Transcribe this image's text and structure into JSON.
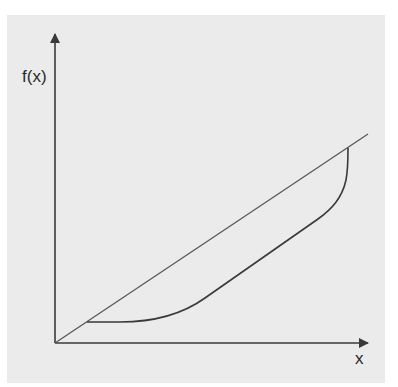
{
  "diagram": {
    "type": "function-plot",
    "y_axis_label": "f(x)",
    "x_axis_label": "x",
    "colors": {
      "background": "#ebebeb",
      "stroke": "#3a3a3a",
      "text": "#2a2a2a"
    },
    "elements": [
      {
        "name": "y-axis",
        "kind": "arrow",
        "from": [
          55,
          343
        ],
        "to": [
          55,
          32
        ]
      },
      {
        "name": "x-axis",
        "kind": "arrow",
        "from": [
          55,
          343
        ],
        "to": [
          370,
          343
        ]
      },
      {
        "name": "linear-line",
        "kind": "line",
        "from": [
          55,
          343
        ],
        "to": [
          368,
          134
        ]
      },
      {
        "name": "convex-curve",
        "kind": "curve",
        "from": [
          87,
          322
        ],
        "to": [
          348,
          148
        ]
      }
    ]
  }
}
